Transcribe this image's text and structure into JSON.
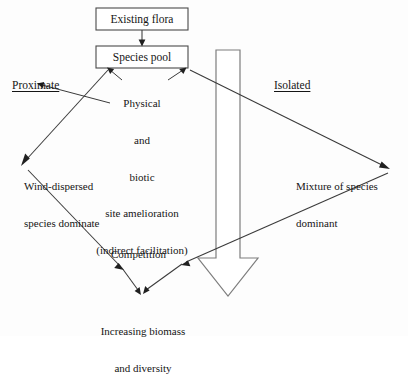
{
  "diagram": {
    "title_nodes": {
      "existing_flora": "Existing flora",
      "species_pool": "Species pool"
    },
    "center_text": {
      "line1": "Physical",
      "line2": "and",
      "line3": "biotic",
      "line4": "site amelioration",
      "line5": "(indirect facilitation)"
    },
    "pathway_tags": {
      "left": "Proximate",
      "right": "Isolated"
    },
    "outcomes": {
      "left_line1": "Wind-dispersed",
      "left_line2": "species dominate",
      "right_line1": "Mixture of species",
      "right_line2": "dominant"
    },
    "process": {
      "competition": "Competition"
    },
    "result": {
      "line1": "Increasing biomass",
      "line2": "and diversity"
    },
    "icons": {
      "flow_arrow": "large-down-block-arrow",
      "link_arrow": "arrowhead"
    },
    "colors": {
      "stroke": "#3a3a3a",
      "box_stroke": "#4a4a4a",
      "block_arrow_stroke": "#7d7d7d",
      "background": "#fdfdfd",
      "text": "#151515"
    }
  }
}
